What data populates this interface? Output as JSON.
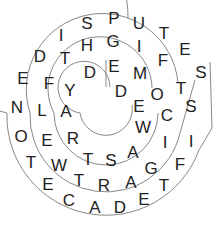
{
  "puzzle": {
    "type": "spiral word puzzle",
    "center": [
      106,
      113
    ],
    "line_color": "#777777",
    "text_color": "#222222",
    "letters": [
      {
        "ch": "D",
        "x": 40,
        "y": 57
      },
      {
        "ch": "I",
        "x": 61,
        "y": 36
      },
      {
        "ch": "S",
        "x": 87,
        "y": 24
      },
      {
        "ch": "P",
        "x": 114,
        "y": 19
      },
      {
        "ch": "U",
        "x": 139,
        "y": 24
      },
      {
        "ch": "T",
        "x": 164,
        "y": 34
      },
      {
        "ch": "E",
        "x": 185,
        "y": 50
      },
      {
        "ch": "S",
        "x": 201,
        "y": 73
      },
      {
        "ch": "E",
        "x": 23,
        "y": 79
      },
      {
        "ch": "N",
        "x": 17,
        "y": 108
      },
      {
        "ch": "O",
        "x": 21,
        "y": 137
      },
      {
        "ch": "T",
        "x": 31,
        "y": 163
      },
      {
        "ch": "E",
        "x": 48,
        "y": 185
      },
      {
        "ch": "C",
        "x": 69,
        "y": 201
      },
      {
        "ch": "A",
        "x": 95,
        "y": 208
      },
      {
        "ch": "D",
        "x": 120,
        "y": 208
      },
      {
        "ch": "E",
        "x": 144,
        "y": 200
      },
      {
        "ch": "T",
        "x": 164,
        "y": 186
      },
      {
        "ch": "F",
        "x": 180,
        "y": 165
      },
      {
        "ch": "I",
        "x": 191,
        "y": 142
      },
      {
        "ch": "S",
        "x": 191,
        "y": 107
      },
      {
        "ch": "T",
        "x": 65,
        "y": 59
      },
      {
        "ch": "H",
        "x": 87,
        "y": 46
      },
      {
        "ch": "G",
        "x": 113,
        "y": 42
      },
      {
        "ch": "I",
        "x": 139,
        "y": 47
      },
      {
        "ch": "F",
        "x": 163,
        "y": 61
      },
      {
        "ch": "T",
        "x": 181,
        "y": 89
      },
      {
        "ch": "C",
        "x": 167,
        "y": 116
      },
      {
        "ch": "I",
        "x": 165,
        "y": 143
      },
      {
        "ch": "G",
        "x": 151,
        "y": 169
      },
      {
        "ch": "A",
        "x": 131,
        "y": 183
      },
      {
        "ch": "R",
        "x": 104,
        "y": 186
      },
      {
        "ch": "T",
        "x": 79,
        "y": 181
      },
      {
        "ch": "W",
        "x": 59,
        "y": 166
      },
      {
        "ch": "E",
        "x": 47,
        "y": 141
      },
      {
        "ch": "L",
        "x": 42,
        "y": 111
      },
      {
        "ch": "F",
        "x": 49,
        "y": 84
      },
      {
        "ch": "Y",
        "x": 70,
        "y": 91
      },
      {
        "ch": "D",
        "x": 90,
        "y": 73
      },
      {
        "ch": "E",
        "x": 114,
        "y": 67
      },
      {
        "ch": "M",
        "x": 140,
        "y": 74
      },
      {
        "ch": "O",
        "x": 157,
        "y": 95
      },
      {
        "ch": "D",
        "x": 121,
        "y": 92
      },
      {
        "ch": "E",
        "x": 139,
        "y": 107
      },
      {
        "ch": "W",
        "x": 143,
        "y": 128
      },
      {
        "ch": "A",
        "x": 133,
        "y": 153
      },
      {
        "ch": "S",
        "x": 111,
        "y": 161
      },
      {
        "ch": "T",
        "x": 88,
        "y": 160
      },
      {
        "ch": "R",
        "x": 73,
        "y": 139
      },
      {
        "ch": "A",
        "x": 66,
        "y": 112
      }
    ]
  }
}
